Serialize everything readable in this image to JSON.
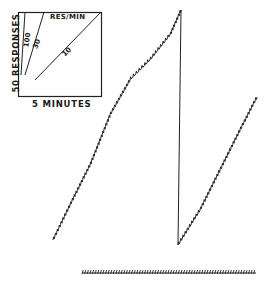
{
  "chart_data": {
    "type": "line",
    "title": "",
    "inset": {
      "ylabel": "50 RESPONSES",
      "xlabel": "5 MINUTES",
      "header": "RES/MIN",
      "rate_lines": [
        {
          "label": "100",
          "rate": 100
        },
        {
          "label": "30",
          "rate": 30
        },
        {
          "label": "10",
          "rate": 10
        }
      ]
    },
    "series": [
      {
        "name": "cumulative-record-segment-1",
        "points_px": [
          [
            53,
            240
          ],
          [
            70,
            205
          ],
          [
            90,
            165
          ],
          [
            110,
            115
          ],
          [
            130,
            80
          ],
          [
            150,
            60
          ],
          [
            170,
            35
          ],
          [
            181,
            10
          ]
        ]
      },
      {
        "name": "pen-reset",
        "points_px": [
          [
            181,
            10
          ],
          [
            178,
            245
          ]
        ]
      },
      {
        "name": "cumulative-record-segment-2",
        "points_px": [
          [
            178,
            245
          ],
          [
            200,
            210
          ],
          [
            220,
            170
          ],
          [
            240,
            130
          ],
          [
            257,
            97
          ]
        ]
      }
    ],
    "event_marker": {
      "y_px": 272,
      "x_start_px": 82,
      "x_end_px": 256
    },
    "grid": false,
    "legend": "none"
  }
}
